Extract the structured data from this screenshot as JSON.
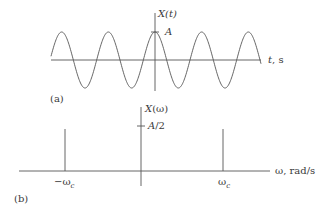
{
  "panel_a": {
    "label": "(a)",
    "y_axis_label": "X(t)",
    "x_axis_label": "t, s",
    "amplitude_label": "A",
    "signal": "cosine",
    "periods_shown": 4.5
  },
  "panel_b": {
    "label": "(b)",
    "y_axis_label": "X(ω)",
    "x_axis_label": "ω, rad/s",
    "impulse_height_label": "A/2",
    "neg_freq_label": "−ωc",
    "pos_freq_label": "ωc",
    "neg_freq_symbol": "−ω",
    "pos_freq_symbol": "ω",
    "freq_subscript": "c"
  },
  "colors": {
    "line": "#555555",
    "text": "#3a3a3a",
    "background": "#ffffff"
  },
  "chart_data": [
    {
      "type": "line",
      "title": "(a) Time-domain cosine signal",
      "xlabel": "t, s",
      "ylabel": "X(t)",
      "series": [
        {
          "name": "X(t) = A cos(ωc t)",
          "amplitude": "A",
          "periods": 4.5
        }
      ],
      "annotations": [
        "A"
      ],
      "grid": false
    },
    {
      "type": "bar",
      "title": "(b) Frequency spectrum (impulses)",
      "xlabel": "ω, rad/s",
      "ylabel": "X(ω)",
      "categories": [
        "−ωc",
        "ωc"
      ],
      "values": [
        "A/2",
        "A/2"
      ],
      "annotations": [
        "A/2"
      ],
      "grid": false
    }
  ]
}
